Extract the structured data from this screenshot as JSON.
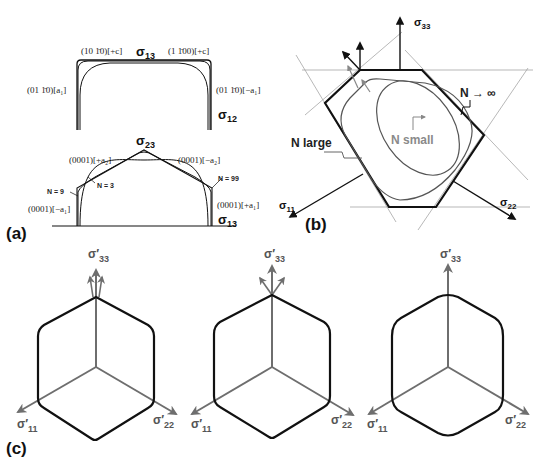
{
  "figure": {
    "panel_a": {
      "label": "(a)",
      "top": {
        "title_sigma": "σ",
        "title_sub": "13",
        "right_sigma": "σ",
        "right_sub": "12",
        "label_top_left": "(10 1̄0)[+c]",
        "label_top_right": "(1 1̄00)[+c]",
        "label_left": "(01 1̄0)[a₁]",
        "label_right": "(01 1̄0)[−a₁]"
      },
      "bottom": {
        "title_sigma": "σ",
        "title_sub": "23",
        "right_sigma": "σ",
        "right_sub": "13",
        "label_upper_left": "(0001)[+a₂]",
        "label_upper_right": "(0001)[−a₂]",
        "label_lower_left": "(0001)[−a₁]",
        "label_lower_right": "(0001)[+a₁]",
        "n9": "N = 9",
        "n3": "N = 3",
        "n99": "N = 99"
      }
    },
    "panel_b": {
      "label": "(b)",
      "axis_33_sigma": "σ",
      "axis_33_sub": "33",
      "axis_11_sigma": "σ",
      "axis_11_sub": "11",
      "axis_22_sigma": "σ",
      "axis_22_sub": "22",
      "n_infinity": "N → ∞",
      "n_large": "N  large",
      "n_small": "N  small"
    },
    "panel_c": {
      "label": "(c)",
      "hexagons": [
        {
          "s33": "σ′",
          "s33_sub": "33",
          "s11": "σ′",
          "s11_sub": "11",
          "s22": "σ′",
          "s22_sub": "22"
        },
        {
          "s33": "σ′",
          "s33_sub": "33",
          "s11": "σ′",
          "s11_sub": "11",
          "s22": "σ′",
          "s22_sub": "22"
        },
        {
          "s33": "σ′",
          "s33_sub": "33",
          "s11": "σ′",
          "s11_sub": "11",
          "s22": "σ′",
          "s22_sub": "22"
        }
      ]
    },
    "colors": {
      "ink": "#111111",
      "gray_axis": "#6e6e6e",
      "light_line": "#9a9a9a"
    }
  }
}
